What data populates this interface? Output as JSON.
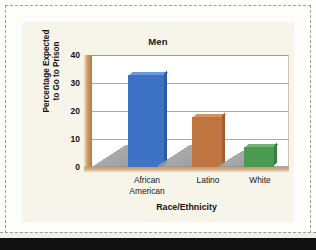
{
  "chart_data": {
    "type": "bar",
    "title": "Men",
    "xlabel": "Race/Ethnicity",
    "ylabel_line1": "Percentage Expected",
    "ylabel_line2": "to Go to Prison",
    "categories": [
      "African American",
      "Latino",
      "White"
    ],
    "category_lines": [
      [
        "African",
        "American"
      ],
      [
        "Latino"
      ],
      [
        "White"
      ]
    ],
    "values": [
      33,
      18,
      7
    ],
    "ylim": [
      0,
      40
    ],
    "yticks": [
      40,
      30,
      20,
      10,
      0
    ],
    "grid": true,
    "legend": "none",
    "bar_colors": [
      "#3d72c4",
      "#c07540",
      "#4a9a52"
    ],
    "bar_colors_top": [
      "#6c9ade",
      "#d59363",
      "#6fb476"
    ],
    "bar_colors_side": [
      "#2b5ba6",
      "#a35e2e",
      "#3a7d41"
    ]
  },
  "figure": {
    "background": "#f7f5ea",
    "axis_wall_color": "#b87a3c",
    "gridline_color": "#a9a9a9"
  }
}
